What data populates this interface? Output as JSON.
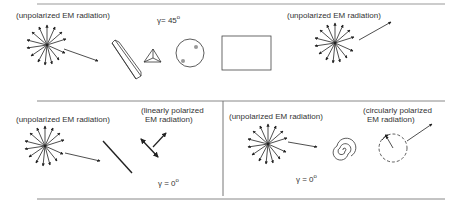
{
  "panels": {
    "top": {
      "left_label": "(unpolarized EM radiation)",
      "right_label": "(unpolarized EM radiation)",
      "gamma_symbol": "γ",
      "gamma_value": "= 45",
      "gamma_unit": "o",
      "components": [
        "starburst",
        "long-prism",
        "triangle-crystal",
        "circular-plate",
        "rectangle-slab",
        "starburst"
      ]
    },
    "bottom_left": {
      "source_label": "(unpolarized EM radiation)",
      "result_label_line1": "(linearly polarized",
      "result_label_line2": "EM radiation)",
      "gamma_symbol": "γ",
      "gamma_value": " = 0",
      "gamma_unit": "o"
    },
    "bottom_right": {
      "source_label": "(unpolarized EM radiation)",
      "result_label_line1": "(circularly polarized",
      "result_label_line2": "EM radiation)",
      "gamma_symbol": "γ",
      "gamma_value": " = 0",
      "gamma_unit": "o"
    }
  },
  "colors": {
    "line": "#222222",
    "rule": "#888888",
    "text": "#333333"
  }
}
